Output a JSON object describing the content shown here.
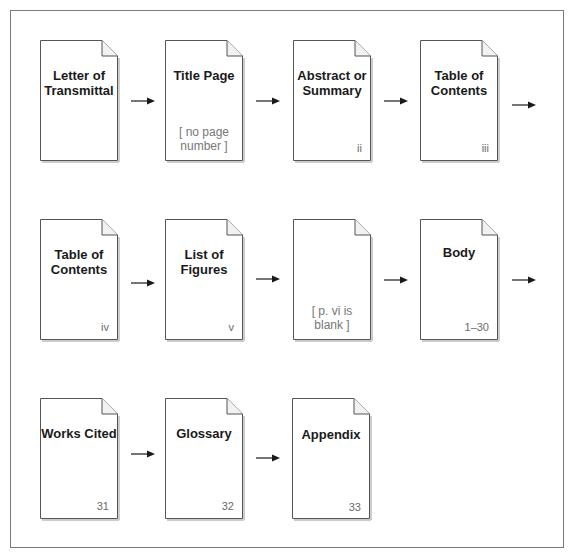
{
  "diagram": {
    "type": "report-page-sequence",
    "rows": [
      {
        "pages": [
          {
            "title": "Letter of Transmittal",
            "page_number": "",
            "note": ""
          },
          {
            "title": "Title Page",
            "page_number": "",
            "note": "[ no page number ]"
          },
          {
            "title": "Abstract or Summary",
            "page_number": "ii",
            "note": ""
          },
          {
            "title": "Table of Contents",
            "page_number": "iii",
            "note": ""
          }
        ],
        "trailing_arrow": true
      },
      {
        "pages": [
          {
            "title": "Table of Contents",
            "page_number": "iv",
            "note": ""
          },
          {
            "title": "List of Figures",
            "page_number": "v",
            "note": ""
          },
          {
            "title": "",
            "page_number": "",
            "note": "[ p. vi is blank ]"
          },
          {
            "title": "Body",
            "page_number": "1–30",
            "note": ""
          }
        ],
        "trailing_arrow": true
      },
      {
        "pages": [
          {
            "title": "Works Cited",
            "page_number": "31",
            "note": ""
          },
          {
            "title": "Glossary",
            "page_number": "32",
            "note": ""
          },
          {
            "title": "Appendix",
            "page_number": "33",
            "note": ""
          }
        ],
        "trailing_arrow": false
      }
    ]
  },
  "colors": {
    "frame": "#7a7a7a",
    "page_border": "#555555",
    "title_text": "#1a1a1a",
    "number_text": "#6a6a6a",
    "arrow": "#1a1a1a"
  },
  "labels": {
    "r0p0_l1": "Letter of",
    "r0p0_l2": "Transmittal",
    "r0p1_l1": "Title Page",
    "r0p1_n1": "[ no page",
    "r0p1_n2": "number ]",
    "r0p2_l1": "Abstract or",
    "r0p2_l2": "Summary",
    "r0p2_num": "ii",
    "r0p3_l1": "Table of",
    "r0p3_l2": "Contents",
    "r0p3_num": "iii",
    "r1p0_l1": "Table of",
    "r1p0_l2": "Contents",
    "r1p0_num": "iv",
    "r1p1_l1": "List of",
    "r1p1_l2": "Figures",
    "r1p1_num": "v",
    "r1p2_n1": "[ p. vi is",
    "r1p2_n2": "blank ]",
    "r1p3_l1": "Body",
    "r1p3_num": "1–30",
    "r2p0_l1": "Works Cited",
    "r2p0_num": "31",
    "r2p1_l1": "Glossary",
    "r2p1_num": "32",
    "r2p2_l1": "Appendix",
    "r2p2_num": "33"
  }
}
